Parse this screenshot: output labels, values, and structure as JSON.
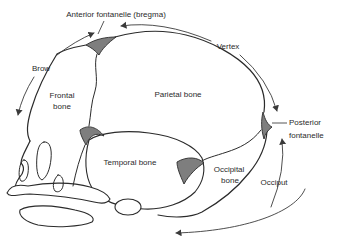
{
  "diagram": {
    "labels": {
      "anterior_fontanelle": "Anterior fontanelle (bregma)",
      "vertex": "Vertex",
      "brow": "Brow",
      "frontal_bone_line1": "Frontal",
      "frontal_bone_line2": "bone",
      "parietal_bone": "Parietal bone",
      "posterior_fontanelle_line1": "Posterior",
      "posterior_fontanelle_line2": "fontanelle",
      "temporal_bone": "Temporal bone",
      "occipital_bone_line1": "Occipital",
      "occipital_bone_line2": "bone",
      "occiput": "Occiput"
    },
    "colors": {
      "line": "#2b2b2b",
      "text": "#2b2b2b",
      "fontanelle_fill": "#7e7e7e",
      "background": "#ffffff"
    }
  }
}
